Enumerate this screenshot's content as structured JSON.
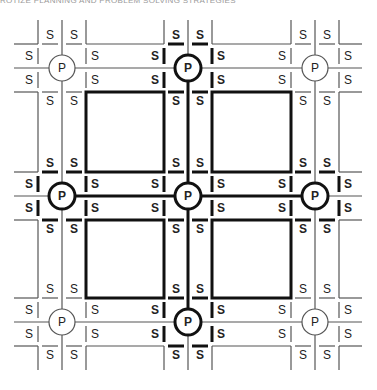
{
  "caption": "ROTIZE PLANNING AND PROBLEM SOLVING STRATEGIES",
  "diagram": {
    "node_label": "P",
    "marker_label": "S",
    "columns": [
      62,
      188,
      315
    ],
    "rows": [
      68,
      196,
      322
    ],
    "highlighted_nodes": [
      {
        "col": 1,
        "row": 0
      },
      {
        "col": 0,
        "row": 1
      },
      {
        "col": 1,
        "row": 1
      },
      {
        "col": 2,
        "row": 1
      },
      {
        "col": 1,
        "row": 2
      }
    ],
    "plain_nodes": [
      {
        "col": 0,
        "row": 0
      },
      {
        "col": 2,
        "row": 0
      },
      {
        "col": 0,
        "row": 2
      },
      {
        "col": 2,
        "row": 2
      }
    ],
    "blocks": [
      {
        "x": 86,
        "y": 94,
        "w": 77,
        "h": 78
      },
      {
        "x": 212,
        "y": 94,
        "w": 78,
        "h": 78
      },
      {
        "x": 86,
        "y": 220,
        "w": 77,
        "h": 78
      },
      {
        "x": 212,
        "y": 220,
        "w": 78,
        "h": 78
      }
    ]
  }
}
